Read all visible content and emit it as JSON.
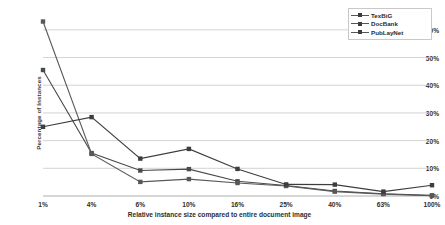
{
  "chart_data": {
    "type": "line",
    "title": "",
    "xlabel": "Relative instance size compared to entire document image",
    "ylabel": "Percentage of Instances",
    "categories": [
      "1%",
      "4%",
      "6%",
      "10%",
      "16%",
      "25%",
      "40%",
      "63%",
      "100%"
    ],
    "ylim": [
      0,
      65
    ],
    "yticks": [
      "0%",
      "10%",
      "20%",
      "30%",
      "40%",
      "50%",
      "60%"
    ],
    "ytick_values": [
      0,
      10,
      20,
      30,
      40,
      50,
      60
    ],
    "grid": true,
    "legend_position": "top-right",
    "series": [
      {
        "name": "TexBiG",
        "color": "#4a4a4a",
        "marker": "square",
        "values": [
          45.5,
          15.5,
          9.2,
          9.7,
          5.3,
          3.8,
          1.8,
          0.8,
          0.2
        ]
      },
      {
        "name": "DocBank",
        "color": "#585858",
        "marker": "square",
        "values": [
          63.0,
          15.2,
          5.1,
          6.1,
          4.7,
          3.6,
          1.6,
          0.7,
          0.1
        ]
      },
      {
        "name": "PubLayNet",
        "color": "#3d3d3d",
        "marker": "square",
        "values": [
          25.0,
          28.5,
          13.5,
          17.0,
          9.8,
          4.2,
          4.1,
          1.6,
          3.9
        ]
      }
    ]
  },
  "legend": {
    "items": [
      {
        "label": "TexBiG"
      },
      {
        "label": "DocBank"
      },
      {
        "label": "PubLayNet"
      }
    ]
  },
  "axes": {
    "y_title": "Percentage of Instances",
    "x_title": "Relative instance size compared to entire document image"
  }
}
